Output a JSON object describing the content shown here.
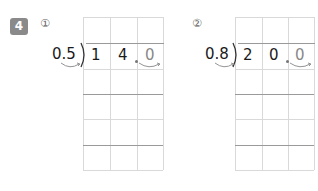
{
  "problem": {
    "number": "4",
    "badge_color": "#8a8a8a"
  },
  "items": [
    {
      "label": "①",
      "divisor": "0.5",
      "dividend_digits": [
        "1",
        "4",
        "0"
      ],
      "moved_digit_index": 2,
      "decimal_point_marker": "."
    },
    {
      "label": "②",
      "divisor": "0.8",
      "dividend_digits": [
        "2",
        "0",
        "0"
      ],
      "moved_digit_index": 2,
      "decimal_point_marker": "."
    }
  ]
}
